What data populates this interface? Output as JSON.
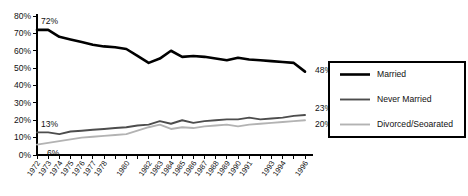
{
  "chart_data": {
    "type": "line",
    "title": "",
    "xlabel": "",
    "ylabel": "",
    "ylim": [
      0,
      80
    ],
    "ytick_labels": [
      "0%",
      "10%",
      "20%",
      "30%",
      "40%",
      "50%",
      "60%",
      "70%",
      "80%"
    ],
    "ytick_values": [
      0,
      10,
      20,
      30,
      40,
      50,
      60,
      70,
      80
    ],
    "grid": false,
    "legend_position": "right",
    "x": [
      1972,
      1973,
      1974,
      1975,
      1976,
      1977,
      1978,
      1979,
      1980,
      1981,
      1982,
      1983,
      1984,
      1985,
      1986,
      1987,
      1988,
      1989,
      1990,
      1991,
      1992,
      1993,
      1994,
      1995,
      1996
    ],
    "xtick_labels": [
      "1972",
      "1973",
      "1974",
      "1975",
      "1976",
      "1977",
      "1978",
      "",
      "1980",
      "",
      "1982",
      "1983",
      "1984",
      "1985",
      "1986",
      "1987",
      "1988",
      "1989",
      "1990",
      "1991",
      "",
      "1993",
      "1994",
      "",
      "1996"
    ],
    "series": [
      {
        "name": "Married",
        "color": "#000000",
        "width": 2.6,
        "values": [
          72,
          72,
          68,
          66.5,
          65,
          63.5,
          62.5,
          62,
          61,
          57,
          53,
          55.5,
          60,
          56.5,
          57,
          56.5,
          55.5,
          54.5,
          56,
          55,
          54.5,
          54,
          53.5,
          53,
          48
        ],
        "start_label": "72%",
        "end_label": "48%"
      },
      {
        "name": "Never Married",
        "color": "#4d4d4d",
        "width": 1.9,
        "values": [
          13,
          13,
          12,
          13.5,
          14,
          14.5,
          15,
          15.5,
          16,
          17,
          17.5,
          19.5,
          18,
          20,
          18.5,
          19.5,
          20,
          20.5,
          20.5,
          21.5,
          20.5,
          21,
          21.5,
          22.5,
          23
        ],
        "start_label": "13%",
        "end_label": "23%"
      },
      {
        "name": "Divorced/Seoarated",
        "color": "#b3b3b3",
        "width": 1.9,
        "values": [
          6,
          7,
          8,
          9,
          10,
          10.5,
          11,
          11.5,
          12,
          14,
          16,
          17.5,
          15,
          16,
          15.5,
          16.5,
          17,
          17.5,
          16.5,
          17.5,
          18,
          18.5,
          19,
          19.5,
          20
        ],
        "start_label": "6%",
        "end_label": "20%"
      }
    ],
    "annotations": [
      {
        "text": "72%",
        "series": "Married",
        "position": "start"
      },
      {
        "text": "48%",
        "series": "Married",
        "position": "end"
      },
      {
        "text": "13%",
        "series": "Never Married",
        "position": "start"
      },
      {
        "text": "23%",
        "series": "Never Married",
        "position": "end"
      },
      {
        "text": "6%",
        "series": "Divorced/Seoarated",
        "position": "start"
      },
      {
        "text": "20%",
        "series": "Divorced/Seoarated",
        "position": "end"
      }
    ]
  },
  "legend": {
    "entries": [
      {
        "label": "Married"
      },
      {
        "label": "Never Married"
      },
      {
        "label": "Divorced/Seoarated"
      }
    ]
  }
}
